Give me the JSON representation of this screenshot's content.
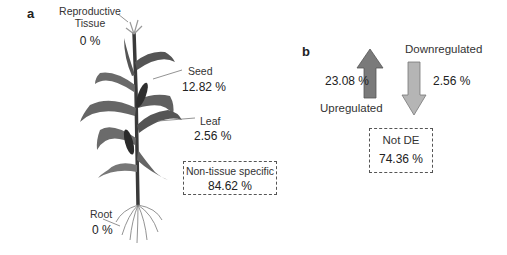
{
  "panel_a": {
    "label": "a",
    "tissues": [
      {
        "name": "Reproductive Tissue",
        "line1": "Reproductive",
        "line2": "Tissue",
        "percent": "0 %"
      },
      {
        "name": "Seed",
        "percent": "12.82 %"
      },
      {
        "name": "Leaf",
        "percent": "2.56 %"
      },
      {
        "name": "Root",
        "percent": "0 %"
      }
    ],
    "non_tissue_box": {
      "title": "Non-tissue specific",
      "percent": "84.62 %"
    }
  },
  "panel_b": {
    "label": "b",
    "upregulated": {
      "label": "Upregulated",
      "percent": "23.08 %",
      "color": "#7a7a7a"
    },
    "downregulated": {
      "label": "Downregulated",
      "percent": "2.56 %",
      "color": "#b5b5b5"
    },
    "not_de_box": {
      "title": "Not DE",
      "percent": "74.36 %"
    }
  }
}
